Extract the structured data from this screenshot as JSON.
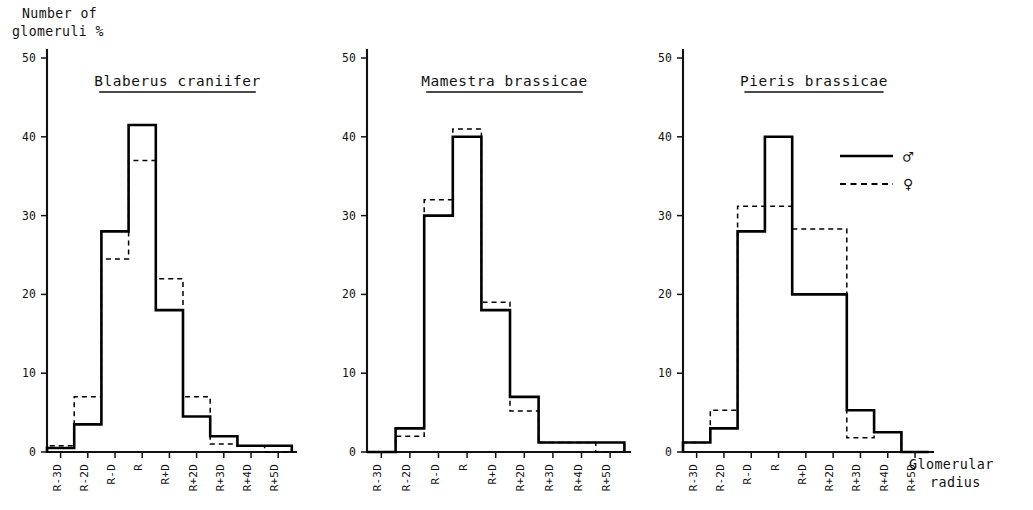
{
  "figure": {
    "y_axis_caption_line1": "Number of",
    "y_axis_caption_line2": "glomeruli %",
    "x_axis_caption_line1": "Glomerular",
    "x_axis_caption_line2": "radius"
  },
  "legend": {
    "male_symbol": "♂",
    "female_symbol": "♀",
    "male_name": "male",
    "female_name": "female",
    "male_line_style": "solid",
    "female_line_style": "dashed"
  },
  "chart_data": [
    {
      "type": "bar",
      "title": "Blaberus craniifer",
      "xlabel": "Glomerular radius",
      "ylabel": "Number of glomeruli %",
      "ylim": [
        0,
        50
      ],
      "yticks": [
        0,
        10,
        20,
        30,
        40,
        50
      ],
      "ytick_labels": [
        "0",
        "10",
        "20",
        "30",
        "40",
        "50"
      ],
      "grid": false,
      "categories": [
        "R-3D",
        "R-2D",
        "R-D",
        "R",
        "R+D",
        "R+2D",
        "R+3D",
        "R+4D",
        "R+5D"
      ],
      "series": [
        {
          "name": "♂",
          "style": "solid",
          "values": [
            0.5,
            3.5,
            28.0,
            41.5,
            18.0,
            4.5,
            2.0,
            0.8,
            0.8
          ]
        },
        {
          "name": "♀",
          "style": "dashed",
          "values": [
            0.8,
            7.0,
            24.5,
            37.0,
            22.0,
            7.0,
            1.0,
            0.8,
            0.0
          ]
        }
      ]
    },
    {
      "type": "bar",
      "title": "Mamestra brassicae",
      "xlabel": "Glomerular radius",
      "ylabel": "Number of glomeruli %",
      "ylim": [
        0,
        50
      ],
      "yticks": [
        0,
        10,
        20,
        30,
        40,
        50
      ],
      "ytick_labels": [
        "0",
        "10",
        "20",
        "30",
        "40",
        "50"
      ],
      "grid": false,
      "categories": [
        "R-3D",
        "R-2D",
        "R-D",
        "R",
        "R+D",
        "R+2D",
        "R+3D",
        "R+4D",
        "R+5D"
      ],
      "series": [
        {
          "name": "♂",
          "style": "solid",
          "values": [
            0.0,
            3.0,
            30.0,
            40.0,
            18.0,
            7.0,
            1.2,
            1.2,
            1.2
          ]
        },
        {
          "name": "♀",
          "style": "dashed",
          "values": [
            0.0,
            2.0,
            32.0,
            41.0,
            19.0,
            5.2,
            1.2,
            1.2,
            0.0
          ]
        }
      ]
    },
    {
      "type": "bar",
      "title": "Pieris brassicae",
      "xlabel": "Glomerular radius",
      "ylabel": "Number of glomeruli %",
      "ylim": [
        0,
        50
      ],
      "yticks": [
        0,
        10,
        20,
        30,
        40,
        50
      ],
      "ytick_labels": [
        "0",
        "10",
        "20",
        "30",
        "40",
        "50"
      ],
      "grid": false,
      "categories": [
        "R-3D",
        "R-2D",
        "R-D",
        "R",
        "R+D",
        "R+2D",
        "R+3D",
        "R+4D",
        "R+5D"
      ],
      "series": [
        {
          "name": "♂",
          "style": "solid",
          "values": [
            1.2,
            3.0,
            28.0,
            40.0,
            20.0,
            20.0,
            5.3,
            2.5,
            0.0
          ]
        },
        {
          "name": "♀",
          "style": "dashed",
          "values": [
            1.2,
            5.3,
            31.2,
            31.2,
            28.3,
            28.3,
            1.8,
            2.5,
            0.0
          ]
        }
      ]
    }
  ]
}
